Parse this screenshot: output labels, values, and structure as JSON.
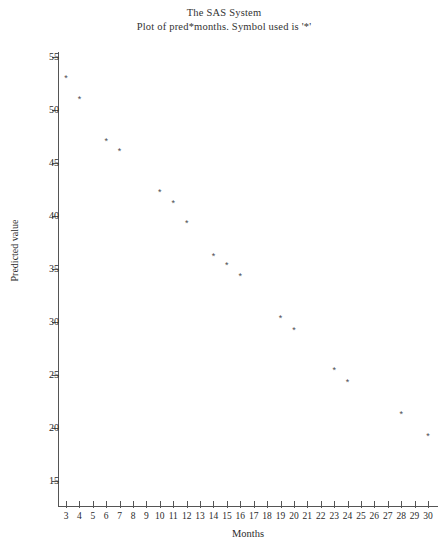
{
  "title": {
    "line1": "The SAS System",
    "line2": "Plot of pred*months. Symbol used is '*'"
  },
  "axes": {
    "x_title": "Months",
    "y_title": "Predicted value"
  },
  "chart_data": {
    "type": "scatter",
    "title": "The SAS System",
    "subtitle": "Plot of pred*months. Symbol used is '*'",
    "xlabel": "Months",
    "ylabel": "Predicted value",
    "symbol": "*",
    "marker_color": "#4a4a50",
    "grid": false,
    "legend": "none",
    "xlim": [
      3,
      30
    ],
    "ylim": [
      13.5,
      56.5
    ],
    "xticks": [
      3,
      4,
      5,
      6,
      7,
      8,
      9,
      10,
      11,
      12,
      13,
      14,
      15,
      16,
      17,
      18,
      19,
      20,
      21,
      22,
      23,
      24,
      25,
      26,
      27,
      28,
      29,
      30
    ],
    "yticks": [
      15,
      20,
      25,
      30,
      35,
      40,
      45,
      50,
      55
    ],
    "x": [
      3,
      4,
      5,
      6,
      8,
      10,
      11,
      12,
      14,
      15,
      16,
      19,
      20,
      23,
      24,
      28,
      30
    ],
    "y": [
      53.0,
      51.0,
      47.0,
      46.1,
      42.2,
      41.2,
      39.3,
      36.2,
      35.3,
      34.3,
      30.3,
      29.2,
      25.4,
      24.3,
      21.3,
      19.2,
      42.2
    ],
    "points": [
      {
        "month": 3,
        "pred": 53.0
      },
      {
        "month": 4,
        "pred": 51.0
      },
      {
        "month": 6,
        "pred": 47.0
      },
      {
        "month": 7,
        "pred": 46.1
      },
      {
        "month": 10,
        "pred": 42.2
      },
      {
        "month": 11,
        "pred": 41.2
      },
      {
        "month": 12,
        "pred": 39.3
      },
      {
        "month": 14,
        "pred": 36.2
      },
      {
        "month": 15,
        "pred": 35.3
      },
      {
        "month": 16,
        "pred": 34.3
      },
      {
        "month": 19,
        "pred": 30.3
      },
      {
        "month": 20,
        "pred": 29.2
      },
      {
        "month": 23,
        "pred": 25.4
      },
      {
        "month": 24,
        "pred": 24.3
      },
      {
        "month": 28,
        "pred": 21.3
      },
      {
        "month": 30,
        "pred": 19.2
      }
    ]
  }
}
